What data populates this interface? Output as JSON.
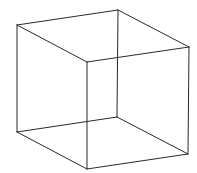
{
  "figure": {
    "type": "wireframe-cube",
    "width": 197,
    "height": 173,
    "background": "#ffffff",
    "stroke_color": "#2a2a2a",
    "vertices": {
      "A": [
        17,
        25
      ],
      "B": [
        118,
        10
      ],
      "C": [
        189,
        47
      ],
      "D": [
        87,
        62
      ],
      "E": [
        17,
        132
      ],
      "F": [
        117,
        117
      ],
      "G": [
        188,
        154
      ],
      "H": [
        87,
        169
      ]
    },
    "edges": [
      [
        "A",
        "B"
      ],
      [
        "B",
        "C"
      ],
      [
        "C",
        "D"
      ],
      [
        "D",
        "A"
      ],
      [
        "E",
        "F"
      ],
      [
        "F",
        "G"
      ],
      [
        "G",
        "H"
      ],
      [
        "H",
        "E"
      ],
      [
        "A",
        "E"
      ],
      [
        "B",
        "F"
      ],
      [
        "C",
        "G"
      ],
      [
        "D",
        "H"
      ]
    ]
  }
}
